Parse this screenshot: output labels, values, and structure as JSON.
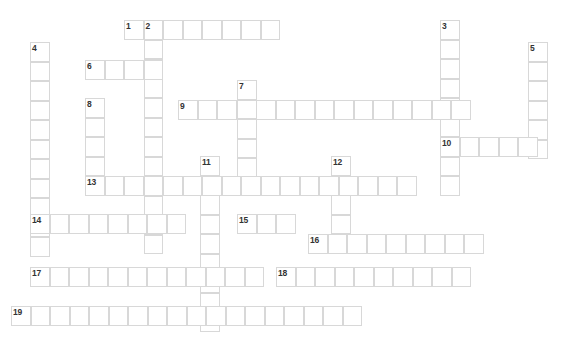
{
  "page": {
    "background_color": "#ffffff",
    "cell_fill_color": "#ffffff",
    "cell_border_color": "#d8d8d8",
    "clue_number_color": "#333333",
    "cell_size_px": 19.5,
    "grid_origin": {
      "x": 11,
      "y": 20
    },
    "width_px": 571,
    "height_px": 346
  },
  "entries": [
    {
      "number": "1",
      "direction": "across",
      "col": 5.8,
      "row": 0,
      "length": 8
    },
    {
      "number": "2",
      "direction": "down",
      "col": 6.8,
      "row": 0,
      "length": 12
    },
    {
      "number": "3",
      "direction": "down",
      "col": 22.0,
      "row": 0,
      "length": 9
    },
    {
      "number": "4",
      "direction": "down",
      "col": 1.0,
      "row": 1.1,
      "length": 10
    },
    {
      "number": "5",
      "direction": "down",
      "col": 26.5,
      "row": 1.1,
      "length": 6
    },
    {
      "number": "6",
      "direction": "across",
      "col": 3.8,
      "row": 2.1,
      "length": 4
    },
    {
      "number": "7",
      "direction": "down",
      "col": 11.6,
      "row": 3.1,
      "length": 5
    },
    {
      "number": "8",
      "direction": "down",
      "col": 3.8,
      "row": 4.0,
      "length": 5
    },
    {
      "number": "9",
      "direction": "across",
      "col": 8.6,
      "row": 4.1,
      "length": 15
    },
    {
      "number": "10",
      "direction": "across",
      "col": 22.0,
      "row": 6.0,
      "length": 5
    },
    {
      "number": "11",
      "direction": "down",
      "col": 9.7,
      "row": 7.0,
      "length": 9
    },
    {
      "number": "12",
      "direction": "down",
      "col": 16.4,
      "row": 7.0,
      "length": 5
    },
    {
      "number": "13",
      "direction": "across",
      "col": 3.8,
      "row": 8.0,
      "length": 17
    },
    {
      "number": "14",
      "direction": "across",
      "col": 1.0,
      "row": 10.0,
      "length": 8
    },
    {
      "number": "15",
      "direction": "across",
      "col": 11.6,
      "row": 10.0,
      "length": 3
    },
    {
      "number": "16",
      "direction": "across",
      "col": 15.2,
      "row": 11.0,
      "length": 9
    },
    {
      "number": "17",
      "direction": "across",
      "col": 1.0,
      "row": 12.7,
      "length": 12
    },
    {
      "number": "18",
      "direction": "across",
      "col": 13.6,
      "row": 12.7,
      "length": 10
    },
    {
      "number": "19",
      "direction": "across",
      "col": 0.0,
      "row": 14.7,
      "length": 18
    }
  ],
  "cells": [
    {
      "x": 124,
      "y": 20
    },
    {
      "x": 143.5,
      "y": 20
    },
    {
      "x": 163,
      "y": 20
    },
    {
      "x": 182.5,
      "y": 20
    },
    {
      "x": 202,
      "y": 20
    },
    {
      "x": 221.5,
      "y": 20
    },
    {
      "x": 241,
      "y": 20
    },
    {
      "x": 260.5,
      "y": 20
    },
    {
      "x": 440,
      "y": 20
    },
    {
      "x": 440,
      "y": 39.5
    },
    {
      "x": 440,
      "y": 59
    },
    {
      "x": 440,
      "y": 78.5
    },
    {
      "x": 440,
      "y": 98
    },
    {
      "x": 440,
      "y": 117.5
    },
    {
      "x": 440,
      "y": 137
    },
    {
      "x": 440,
      "y": 156.5
    },
    {
      "x": 440,
      "y": 176
    },
    {
      "x": 143.5,
      "y": 39.5
    },
    {
      "x": 143.5,
      "y": 59
    },
    {
      "x": 143.5,
      "y": 78.5
    },
    {
      "x": 143.5,
      "y": 98
    },
    {
      "x": 143.5,
      "y": 117.5
    },
    {
      "x": 143.5,
      "y": 137
    },
    {
      "x": 143.5,
      "y": 156.5
    },
    {
      "x": 143.5,
      "y": 176
    },
    {
      "x": 143.5,
      "y": 195.5
    },
    {
      "x": 143.5,
      "y": 215
    },
    {
      "x": 143.5,
      "y": 234.5
    },
    {
      "x": 30,
      "y": 42
    },
    {
      "x": 30,
      "y": 61.5
    },
    {
      "x": 30,
      "y": 81
    },
    {
      "x": 30,
      "y": 100.5
    },
    {
      "x": 30,
      "y": 120
    },
    {
      "x": 30,
      "y": 139.5
    },
    {
      "x": 30,
      "y": 159
    },
    {
      "x": 30,
      "y": 178.5
    },
    {
      "x": 30,
      "y": 198
    },
    {
      "x": 30,
      "y": 217.5
    },
    {
      "x": 30,
      "y": 237
    },
    {
      "x": 528,
      "y": 42
    },
    {
      "x": 528,
      "y": 61.5
    },
    {
      "x": 528,
      "y": 81
    },
    {
      "x": 528,
      "y": 100.5
    },
    {
      "x": 528,
      "y": 120
    },
    {
      "x": 528,
      "y": 139.5
    },
    {
      "x": 85,
      "y": 60
    },
    {
      "x": 104.5,
      "y": 60
    },
    {
      "x": 124,
      "y": 60
    },
    {
      "x": 143.5,
      "y": 60
    },
    {
      "x": 237,
      "y": 80
    },
    {
      "x": 237,
      "y": 99.5
    },
    {
      "x": 237,
      "y": 119
    },
    {
      "x": 237,
      "y": 138.5
    },
    {
      "x": 237,
      "y": 158
    },
    {
      "x": 85,
      "y": 98
    },
    {
      "x": 85,
      "y": 117.5
    },
    {
      "x": 85,
      "y": 137
    },
    {
      "x": 85,
      "y": 156.5
    },
    {
      "x": 85,
      "y": 176
    },
    {
      "x": 178,
      "y": 100
    },
    {
      "x": 197.5,
      "y": 100
    },
    {
      "x": 217,
      "y": 100
    },
    {
      "x": 236.5,
      "y": 100
    },
    {
      "x": 256,
      "y": 100
    },
    {
      "x": 275.5,
      "y": 100
    },
    {
      "x": 295,
      "y": 100
    },
    {
      "x": 314.5,
      "y": 100
    },
    {
      "x": 334,
      "y": 100
    },
    {
      "x": 353.5,
      "y": 100
    },
    {
      "x": 373,
      "y": 100
    },
    {
      "x": 392.5,
      "y": 100
    },
    {
      "x": 412,
      "y": 100
    },
    {
      "x": 431.5,
      "y": 100
    },
    {
      "x": 451,
      "y": 100
    },
    {
      "x": 440,
      "y": 137
    },
    {
      "x": 459.5,
      "y": 137
    },
    {
      "x": 479,
      "y": 137
    },
    {
      "x": 498.5,
      "y": 137
    },
    {
      "x": 518,
      "y": 137
    },
    {
      "x": 200,
      "y": 156
    },
    {
      "x": 200,
      "y": 175.5
    },
    {
      "x": 200,
      "y": 195
    },
    {
      "x": 200,
      "y": 214.5
    },
    {
      "x": 200,
      "y": 234
    },
    {
      "x": 200,
      "y": 253.5
    },
    {
      "x": 200,
      "y": 273
    },
    {
      "x": 200,
      "y": 292.5
    },
    {
      "x": 200,
      "y": 312
    },
    {
      "x": 331,
      "y": 156
    },
    {
      "x": 331,
      "y": 175.5
    },
    {
      "x": 331,
      "y": 195
    },
    {
      "x": 331,
      "y": 214.5
    },
    {
      "x": 331,
      "y": 234
    },
    {
      "x": 85,
      "y": 176
    },
    {
      "x": 104.5,
      "y": 176
    },
    {
      "x": 124,
      "y": 176
    },
    {
      "x": 143.5,
      "y": 176
    },
    {
      "x": 163,
      "y": 176
    },
    {
      "x": 182.5,
      "y": 176
    },
    {
      "x": 202,
      "y": 176
    },
    {
      "x": 221.5,
      "y": 176
    },
    {
      "x": 241,
      "y": 176
    },
    {
      "x": 260.5,
      "y": 176
    },
    {
      "x": 280,
      "y": 176
    },
    {
      "x": 299.5,
      "y": 176
    },
    {
      "x": 319,
      "y": 176
    },
    {
      "x": 338.5,
      "y": 176
    },
    {
      "x": 358,
      "y": 176
    },
    {
      "x": 377.5,
      "y": 176
    },
    {
      "x": 397,
      "y": 176
    },
    {
      "x": 30,
      "y": 214
    },
    {
      "x": 49.5,
      "y": 214
    },
    {
      "x": 69,
      "y": 214
    },
    {
      "x": 88.5,
      "y": 214
    },
    {
      "x": 108,
      "y": 214
    },
    {
      "x": 127.5,
      "y": 214
    },
    {
      "x": 147,
      "y": 214
    },
    {
      "x": 166.5,
      "y": 214
    },
    {
      "x": 237,
      "y": 214
    },
    {
      "x": 256.5,
      "y": 214
    },
    {
      "x": 276,
      "y": 214
    },
    {
      "x": 308,
      "y": 234
    },
    {
      "x": 327.5,
      "y": 234
    },
    {
      "x": 347,
      "y": 234
    },
    {
      "x": 366.5,
      "y": 234
    },
    {
      "x": 386,
      "y": 234
    },
    {
      "x": 405.5,
      "y": 234
    },
    {
      "x": 425,
      "y": 234
    },
    {
      "x": 444.5,
      "y": 234
    },
    {
      "x": 464,
      "y": 234
    },
    {
      "x": 30,
      "y": 267
    },
    {
      "x": 49.5,
      "y": 267
    },
    {
      "x": 69,
      "y": 267
    },
    {
      "x": 88.5,
      "y": 267
    },
    {
      "x": 108,
      "y": 267
    },
    {
      "x": 127.5,
      "y": 267
    },
    {
      "x": 147,
      "y": 267
    },
    {
      "x": 166.5,
      "y": 267
    },
    {
      "x": 186,
      "y": 267
    },
    {
      "x": 205.5,
      "y": 267
    },
    {
      "x": 225,
      "y": 267
    },
    {
      "x": 244.5,
      "y": 267
    },
    {
      "x": 276,
      "y": 267
    },
    {
      "x": 295.5,
      "y": 267
    },
    {
      "x": 315,
      "y": 267
    },
    {
      "x": 334.5,
      "y": 267
    },
    {
      "x": 354,
      "y": 267
    },
    {
      "x": 373.5,
      "y": 267
    },
    {
      "x": 393,
      "y": 267
    },
    {
      "x": 412.5,
      "y": 267
    },
    {
      "x": 432,
      "y": 267
    },
    {
      "x": 451.5,
      "y": 267
    },
    {
      "x": 11,
      "y": 306
    },
    {
      "x": 30.5,
      "y": 306
    },
    {
      "x": 50,
      "y": 306
    },
    {
      "x": 69.5,
      "y": 306
    },
    {
      "x": 89,
      "y": 306
    },
    {
      "x": 108.5,
      "y": 306
    },
    {
      "x": 128,
      "y": 306
    },
    {
      "x": 147.5,
      "y": 306
    },
    {
      "x": 167,
      "y": 306
    },
    {
      "x": 186.5,
      "y": 306
    },
    {
      "x": 206,
      "y": 306
    },
    {
      "x": 225.5,
      "y": 306
    },
    {
      "x": 245,
      "y": 306
    },
    {
      "x": 264.5,
      "y": 306
    },
    {
      "x": 284,
      "y": 306
    },
    {
      "x": 303.5,
      "y": 306
    },
    {
      "x": 323,
      "y": 306
    },
    {
      "x": 342.5,
      "y": 306
    }
  ],
  "numbers": [
    {
      "label": "1",
      "x": 126,
      "y": 22
    },
    {
      "label": "2",
      "x": 145.5,
      "y": 22
    },
    {
      "label": "3",
      "x": 442,
      "y": 22
    },
    {
      "label": "4",
      "x": 32,
      "y": 44
    },
    {
      "label": "5",
      "x": 530,
      "y": 44
    },
    {
      "label": "6",
      "x": 87,
      "y": 62
    },
    {
      "label": "7",
      "x": 239,
      "y": 82
    },
    {
      "label": "8",
      "x": 87,
      "y": 100
    },
    {
      "label": "9",
      "x": 180,
      "y": 102
    },
    {
      "label": "10",
      "x": 442,
      "y": 139
    },
    {
      "label": "11",
      "x": 202,
      "y": 158
    },
    {
      "label": "12",
      "x": 333,
      "y": 158
    },
    {
      "label": "13",
      "x": 87,
      "y": 178
    },
    {
      "label": "14",
      "x": 32,
      "y": 216
    },
    {
      "label": "15",
      "x": 239,
      "y": 216
    },
    {
      "label": "16",
      "x": 310,
      "y": 236
    },
    {
      "label": "17",
      "x": 32,
      "y": 269
    },
    {
      "label": "18",
      "x": 278,
      "y": 269
    },
    {
      "label": "19",
      "x": 13,
      "y": 308
    }
  ]
}
